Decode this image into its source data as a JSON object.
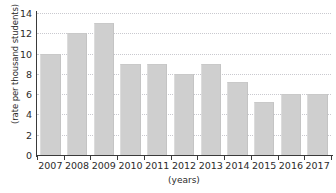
{
  "chart_data": {
    "type": "bar",
    "title": "",
    "subtitle": "",
    "xlabel": "(years)",
    "ylabel": "(rate per thousand students)",
    "categories": [
      "2007",
      "2008",
      "2009",
      "2010",
      "2011",
      "2012",
      "2013",
      "2014",
      "2015",
      "2016",
      "2017"
    ],
    "values": [
      10,
      12,
      13,
      9,
      9,
      8,
      9,
      7.2,
      5.2,
      6,
      6
    ],
    "series": [
      {
        "name": "rate per thousand students",
        "values": [
          10,
          12,
          13,
          9,
          9,
          8,
          9,
          7.2,
          5.2,
          6,
          6
        ]
      }
    ],
    "ylim": [
      0,
      14
    ],
    "yticks": [
      0,
      2,
      4,
      6,
      8,
      10,
      12,
      14
    ],
    "ytick_labels": [
      "0",
      "2",
      "4",
      "6",
      "8",
      "10",
      "12",
      "14"
    ],
    "grid": true,
    "grid_axis": "y",
    "grid_style": "dotted",
    "legend": false,
    "legend_position": "none",
    "bar_color": "#cfcfcf",
    "axis_color": "#3a3a3a",
    "gridline_color": "#c9c9cf",
    "background_color": "#ffffff",
    "text_color": "#2b2b2b"
  }
}
